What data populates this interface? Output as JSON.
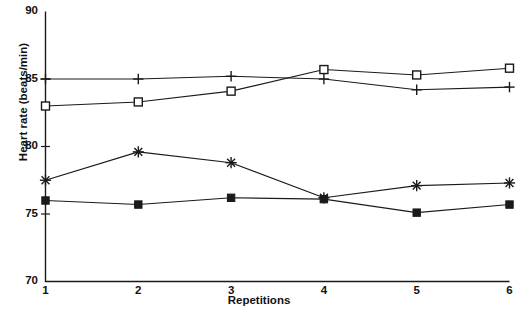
{
  "chart_data": {
    "type": "line",
    "title": "",
    "xlabel": "Repetitions",
    "ylabel": "Heart rate (beats/min)",
    "x": [
      1,
      2,
      3,
      4,
      5,
      6
    ],
    "categories": [
      "1",
      "2",
      "3",
      "4",
      "5",
      "6"
    ],
    "xlim": [
      1,
      6
    ],
    "ylim": [
      70,
      90
    ],
    "yticks": [
      70,
      75,
      80,
      85,
      90
    ],
    "ytick_labels": [
      "70",
      "75",
      "80",
      "85",
      "90"
    ],
    "xtick_labels": [
      "1",
      "2",
      "3",
      "4",
      "5",
      "6"
    ],
    "grid": false,
    "legend": "none",
    "line_color": "#1a1a1a",
    "series": [
      {
        "name": "plus-series",
        "marker": "plus",
        "values": [
          85.0,
          85.0,
          85.2,
          85.0,
          84.2,
          84.4
        ]
      },
      {
        "name": "open-square-series",
        "marker": "open-square",
        "values": [
          83.0,
          83.3,
          84.1,
          85.7,
          85.3,
          85.8
        ]
      },
      {
        "name": "asterisk-series",
        "marker": "asterisk",
        "values": [
          77.5,
          79.6,
          78.8,
          76.2,
          77.1,
          77.3
        ]
      },
      {
        "name": "filled-square-series",
        "marker": "filled-square",
        "values": [
          76.0,
          75.7,
          76.2,
          76.1,
          75.1,
          75.7
        ]
      }
    ]
  }
}
